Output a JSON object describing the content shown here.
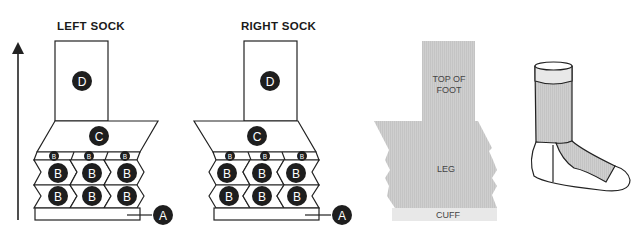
{
  "diagram": {
    "left_sock": {
      "title": "LEFT SOCK",
      "labels": {
        "top": "D",
        "heel_flap": "C",
        "gusset_small": "B",
        "leg_panels": "B",
        "cuff": "A"
      }
    },
    "right_sock": {
      "title": "RIGHT SOCK",
      "labels": {
        "top": "D",
        "heel_flap": "C",
        "gusset_small": "B",
        "leg_panels": "B",
        "cuff": "A"
      }
    },
    "pattern_key": {
      "top_of_foot_line1": "TOP OF",
      "top_of_foot_line2": "FOOT",
      "leg": "LEG",
      "cuff": "CUFF"
    },
    "colors": {
      "line": "#222222",
      "badge": "#1e1e1e",
      "badge_text": "#ffffff",
      "fill_gray": "#c9c9c9",
      "fill_light": "#e6e6e6"
    }
  }
}
